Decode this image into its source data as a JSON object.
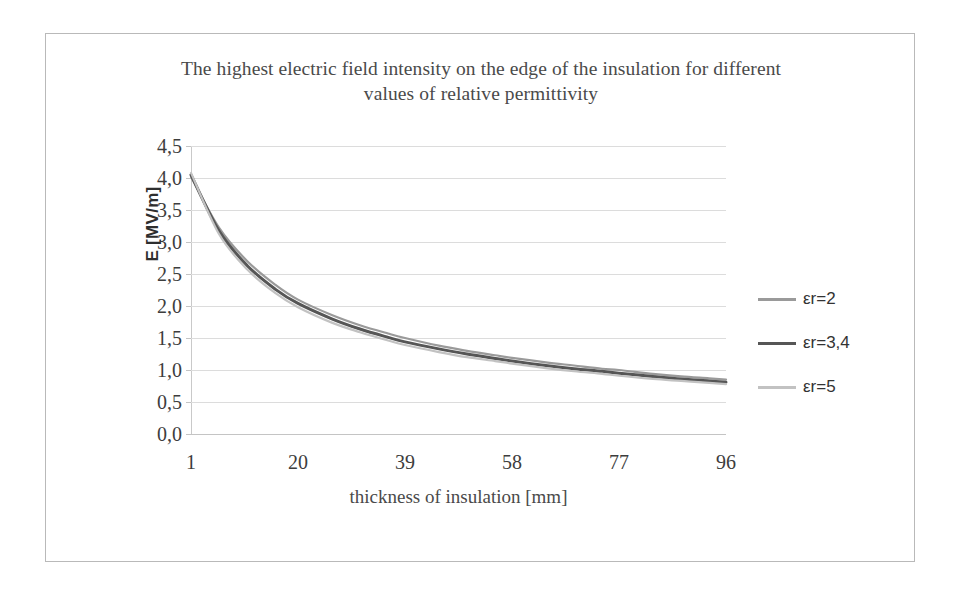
{
  "chart_data": {
    "type": "line",
    "title": "The highest electric field intensity on the edge of the insulation for different values of relative permittivity",
    "title_lines": [
      "The highest electric field intensity on the edge of the insulation for different",
      "values of relative permittivity"
    ],
    "xlabel": "thickness of insulation [mm]",
    "ylabel": "E [MV/m]",
    "xlim": [
      1,
      96
    ],
    "ylim": [
      0.0,
      4.5
    ],
    "grid": true,
    "legend_position": "right",
    "xtick_labels": [
      "1",
      "20",
      "39",
      "58",
      "77",
      "96"
    ],
    "xticks": [
      1,
      20,
      39,
      58,
      77,
      96
    ],
    "ytick_labels": [
      "0,0",
      "0,5",
      "1,0",
      "1,5",
      "2,0",
      "2,5",
      "3,0",
      "3,5",
      "4,0",
      "4,5"
    ],
    "yticks": [
      0.0,
      0.5,
      1.0,
      1.5,
      2.0,
      2.5,
      3.0,
      3.5,
      4.0,
      4.5
    ],
    "x": [
      1,
      6,
      11,
      16,
      20,
      26,
      31,
      36,
      39,
      45,
      50,
      55,
      58,
      64,
      69,
      74,
      77,
      83,
      88,
      93,
      96
    ],
    "series": [
      {
        "name": "εr=2",
        "color": "#9a9a9a",
        "width": 2.2,
        "values": [
          4.02,
          3.22,
          2.7,
          2.33,
          2.1,
          1.86,
          1.7,
          1.57,
          1.5,
          1.38,
          1.3,
          1.23,
          1.19,
          1.12,
          1.07,
          1.02,
          1.0,
          0.94,
          0.9,
          0.87,
          0.85
        ]
      },
      {
        "name": "εr=3,4",
        "color": "#565656",
        "width": 3.0,
        "values": [
          4.05,
          3.17,
          2.63,
          2.26,
          2.04,
          1.8,
          1.64,
          1.51,
          1.44,
          1.33,
          1.25,
          1.18,
          1.14,
          1.07,
          1.02,
          0.98,
          0.95,
          0.9,
          0.86,
          0.83,
          0.81
        ]
      },
      {
        "name": "εr=5",
        "color": "#c2c2c2",
        "width": 2.2,
        "values": [
          4.08,
          3.12,
          2.57,
          2.2,
          1.98,
          1.74,
          1.59,
          1.46,
          1.39,
          1.28,
          1.2,
          1.14,
          1.1,
          1.03,
          0.98,
          0.94,
          0.91,
          0.86,
          0.83,
          0.8,
          0.78
        ]
      }
    ]
  },
  "legend": {
    "items": [
      {
        "label": "εr=2"
      },
      {
        "label": "εr=3,4"
      },
      {
        "label": "εr=5"
      }
    ]
  }
}
